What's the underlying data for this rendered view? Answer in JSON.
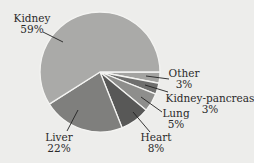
{
  "chart_data": {
    "type": "pie",
    "title": "",
    "categories": [
      "Other",
      "Kidney-pancreas",
      "Lung",
      "Heart",
      "Liver",
      "Kidney"
    ],
    "values": [
      3,
      3,
      5,
      8,
      22,
      59
    ],
    "labels": [
      "Other\n3%",
      "Kidney-pancreas\n3%",
      "Lung\n5%",
      "Heart\n8%",
      "Liver\n22%",
      "Kidney\n59%"
    ],
    "colors": [
      "#a3a3a1",
      "#6f6f6e",
      "#8e8e8c",
      "#585857",
      "#7f7f7d",
      "#aaaaa8"
    ],
    "start_angle_deg": 0,
    "direction": "clockwise",
    "legend": "none",
    "label_style": "callout lines"
  },
  "labels": {
    "kidney": {
      "name": "Kidney",
      "pct": "59%"
    },
    "liver": {
      "name": "Liver",
      "pct": "22%"
    },
    "heart": {
      "name": "Heart",
      "pct": "8%"
    },
    "lung": {
      "name": "Lung",
      "pct": "5%"
    },
    "kidney_pancreas": {
      "name": "Kidney-pancreas",
      "pct": "3%"
    },
    "other": {
      "name": "Other",
      "pct": "3%"
    }
  }
}
